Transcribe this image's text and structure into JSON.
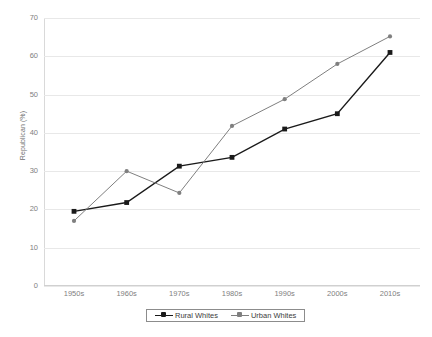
{
  "chart_data": {
    "type": "line",
    "title": "",
    "xlabel": "",
    "ylabel": "Republican (%)",
    "categories": [
      "1950s",
      "1960s",
      "1970s",
      "1980s",
      "1990s",
      "2000s",
      "2010s"
    ],
    "ylim": [
      0,
      70
    ],
    "ytick_step": 10,
    "yticks": [
      70,
      60,
      50,
      40,
      30,
      20,
      10,
      0
    ],
    "grid": "horizontal",
    "legend_position": "bottom-center",
    "series": [
      {
        "name": "Rural Whites",
        "color": "#1a1a1a",
        "marker": "square",
        "values": [
          19.5,
          21.8,
          31.3,
          33.6,
          41.0,
          45.0,
          61.0
        ]
      },
      {
        "name": "Urban Whites",
        "color": "#7f7f7f",
        "marker": "circle",
        "values": [
          17.0,
          30.0,
          24.3,
          41.8,
          48.8,
          58.0,
          65.2
        ]
      }
    ]
  },
  "legend": {
    "items": [
      {
        "label": "Rural Whites"
      },
      {
        "label": "Urban Whites"
      }
    ]
  },
  "axis": {
    "y_title": "Republican (%)"
  }
}
